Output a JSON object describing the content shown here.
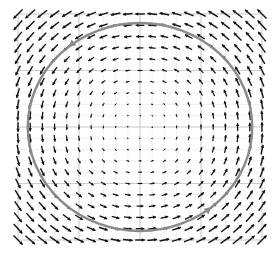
{
  "chart_data": {
    "type": "quiver",
    "title": "",
    "xlabel": "",
    "ylabel": "",
    "field": "rotational vector field (counter-clockwise circulation), magnitude grows with distance from center",
    "vector_formula": {
      "u": "-y",
      "v": "x"
    },
    "grid_points_per_axis": 21,
    "xlim": [
      -1,
      1
    ],
    "ylim": [
      -1,
      1
    ],
    "grid": true,
    "major_grid_lines": 4,
    "circle": {
      "center": [
        0,
        0
      ],
      "radius": 0.92,
      "color": "#888888",
      "direction": "counter-clockwise",
      "arrowheads": 2
    },
    "colors": {
      "arrows": "#111111",
      "grid": "#c8c8c8",
      "circle": "#8a8a8a"
    }
  }
}
